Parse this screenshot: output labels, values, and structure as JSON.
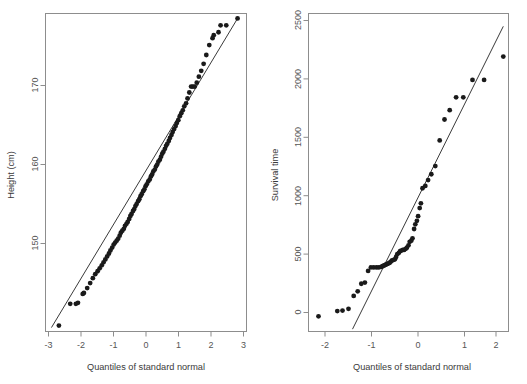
{
  "figure": {
    "type": "qq-plot-pair",
    "panels": [
      "height-qq-panel",
      "survival-qq-panel"
    ]
  },
  "chart_data": [
    {
      "type": "scatter",
      "id": "height-qq",
      "title": "",
      "xlabel": "Quantiles of standard normal",
      "ylabel": "Height (cm)",
      "xlim": [
        -3.45,
        3.3
      ],
      "ylim": [
        143.2,
        175.4
      ],
      "xticks": [
        -3,
        -2,
        -1,
        0,
        1,
        2,
        3
      ],
      "xticklabels": [
        "-3",
        "-2",
        "-1",
        "0",
        "1",
        "2",
        "3"
      ],
      "yticks": [
        150,
        160,
        170
      ],
      "yticklabels": [
        "150",
        "160",
        "170"
      ],
      "grid": false,
      "legend": null,
      "reference_line": {
        "name": "qqline",
        "p1": [
          -3.25,
          143.6
        ],
        "p2": [
          3.0,
          174.9
        ]
      },
      "x": [
        -3.0,
        -2.62,
        -2.43,
        -2.36,
        -2.2,
        -2.16,
        -2.05,
        -1.95,
        -1.86,
        -1.78,
        -1.7,
        -1.63,
        -1.56,
        -1.5,
        -1.44,
        -1.38,
        -1.32,
        -1.27,
        -1.21,
        -1.16,
        -1.11,
        -1.06,
        -1.01,
        -0.96,
        -0.92,
        -0.87,
        -0.82,
        -0.78,
        -0.73,
        -0.69,
        -0.64,
        -0.6,
        -0.56,
        -0.51,
        -0.47,
        -0.43,
        -0.39,
        -0.34,
        -0.3,
        -0.26,
        -0.22,
        -0.17,
        -0.13,
        -0.09,
        -0.05,
        0.0,
        0.05,
        0.09,
        0.13,
        0.17,
        0.22,
        0.26,
        0.3,
        0.34,
        0.39,
        0.43,
        0.47,
        0.51,
        0.56,
        0.6,
        0.64,
        0.69,
        0.73,
        0.78,
        0.82,
        0.87,
        0.92,
        0.96,
        1.01,
        1.06,
        1.11,
        1.16,
        1.21,
        1.27,
        1.32,
        1.38,
        1.44,
        1.5,
        1.56,
        1.63,
        1.7,
        1.78,
        1.86,
        1.95,
        2.05,
        2.16,
        2.2,
        2.36,
        2.43,
        2.62,
        3.0
      ],
      "y": [
        143.8,
        146.0,
        146.0,
        146.1,
        147.0,
        147.1,
        147.6,
        148.1,
        148.6,
        149.0,
        149.3,
        149.6,
        149.9,
        150.2,
        150.5,
        150.8,
        151.1,
        151.4,
        151.7,
        152.0,
        152.2,
        152.4,
        152.6,
        152.9,
        153.2,
        153.4,
        153.6,
        153.9,
        154.1,
        154.3,
        154.6,
        154.9,
        155.1,
        155.4,
        155.6,
        155.9,
        156.1,
        156.4,
        156.6,
        156.9,
        157.1,
        157.4,
        157.6,
        157.9,
        158.1,
        158.4,
        158.6,
        158.9,
        159.1,
        159.4,
        159.6,
        159.9,
        160.1,
        160.4,
        160.6,
        160.9,
        161.2,
        161.4,
        161.7,
        162.0,
        162.2,
        162.5,
        162.8,
        163.1,
        163.4,
        163.7,
        164.0,
        164.3,
        164.6,
        165.0,
        165.3,
        165.6,
        166.0,
        166.3,
        166.8,
        167.4,
        168.0,
        168.0,
        168.0,
        168.4,
        169.0,
        169.6,
        170.3,
        171.2,
        172.2,
        172.9,
        173.2,
        173.5,
        174.2,
        174.2,
        174.9
      ]
    },
    {
      "type": "scatter",
      "id": "survival-qq",
      "title": "",
      "xlabel": "Quantiles of standard normal",
      "ylabel": "Survival time",
      "xlim": [
        -2.55,
        2.45
      ],
      "ylim": [
        -120,
        2610
      ],
      "xticks": [
        -2,
        -1,
        0,
        1,
        2
      ],
      "xticklabels": [
        "-2",
        "-1",
        "0",
        "1",
        "2"
      ],
      "yticks": [
        0,
        500,
        1000,
        1500,
        2000,
        2500
      ],
      "yticklabels": [
        "0",
        "500",
        "1000",
        "1500",
        "2000",
        "2500"
      ],
      "grid": false,
      "legend": null,
      "reference_line": {
        "name": "qqline",
        "p1": [
          -1.45,
          -100
        ],
        "p2": [
          2.32,
          2500
        ]
      },
      "x": [
        -2.3,
        -1.83,
        -1.7,
        -1.55,
        -1.42,
        -1.32,
        -1.23,
        -1.14,
        -1.06,
        -0.99,
        -0.92,
        -0.85,
        -0.79,
        -0.73,
        -0.7,
        -0.67,
        -0.64,
        -0.61,
        -0.58,
        -0.55,
        -0.52,
        -0.49,
        -0.46,
        -0.42,
        -0.39,
        -0.36,
        -0.33,
        -0.29,
        -0.26,
        -0.23,
        -0.19,
        -0.16,
        -0.12,
        -0.09,
        -0.05,
        -0.02,
        0.02,
        0.05,
        0.09,
        0.12,
        0.16,
        0.19,
        0.23,
        0.26,
        0.3,
        0.37,
        0.44,
        0.52,
        0.62,
        0.73,
        0.85,
        0.98,
        1.14,
        1.32,
        1.55,
        1.84,
        2.32
      ],
      "y": [
        10,
        55,
        60,
        75,
        185,
        225,
        290,
        300,
        400,
        430,
        430,
        430,
        430,
        435,
        440,
        445,
        450,
        455,
        460,
        465,
        470,
        480,
        490,
        495,
        500,
        520,
        545,
        555,
        570,
        575,
        580,
        580,
        590,
        600,
        620,
        650,
        660,
        680,
        760,
        800,
        830,
        870,
        940,
        980,
        1110,
        1130,
        1180,
        1230,
        1300,
        1520,
        1700,
        1780,
        1890,
        1890,
        2040,
        2040,
        2240,
        2420,
        2500
      ]
    }
  ],
  "panel_left": {
    "name": "height-qq-panel",
    "ylabel": "Height (cm)",
    "xlabel": "Quantiles of standard normal",
    "yticklabels": [
      "170",
      "160",
      "150"
    ],
    "xticklabels": [
      "-3",
      "-2",
      "-1",
      "0",
      "1",
      "2",
      "3"
    ]
  },
  "panel_right": {
    "name": "survival-qq-panel",
    "ylabel": "Survival time",
    "xlabel": "Quantiles of standard normal",
    "yticklabels": [
      "2500",
      "2000",
      "1500",
      "1000",
      "500",
      "0"
    ],
    "xticklabels": [
      "-2",
      "-1",
      "0",
      "1",
      "2"
    ]
  },
  "colors": {
    "point": "#1a1a1a",
    "line": "#3a3a3a",
    "axis": "#8d8d8d",
    "text": "#555555",
    "background": "#ffffff"
  }
}
